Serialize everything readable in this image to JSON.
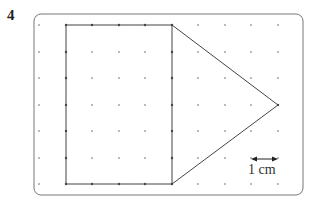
{
  "question": {
    "number": "4"
  },
  "grid": {
    "columns_x": [
      39,
      66,
      92,
      119,
      145,
      172,
      198,
      225,
      251,
      278
    ],
    "rows_y": [
      25,
      52,
      78,
      105,
      131,
      158,
      184
    ],
    "spacing_cm": 1,
    "dot_color": "#9a9a9a",
    "edge_dot_color": "#444444"
  },
  "border": {
    "x": 34,
    "y": 14,
    "width": 269,
    "height": 181,
    "radius": 7,
    "color": "#777777"
  },
  "shape": {
    "description": "Pentagon composed of a 4 cm by 6 cm rectangle joined to an isosceles triangle",
    "rectangle": {
      "x1": 66,
      "y1": 25,
      "x2": 172,
      "y2": 184,
      "width_cm": 4,
      "height_cm": 6
    },
    "triangle": {
      "points": [
        [
          172,
          25
        ],
        [
          278,
          105
        ],
        [
          172,
          184
        ]
      ],
      "base_cm": 6,
      "height_cm": 4
    },
    "stroke_color": "#444444"
  },
  "scale": {
    "label": "1 cm",
    "arrow": {
      "x1": 251,
      "x2": 278,
      "y": 159
    }
  }
}
